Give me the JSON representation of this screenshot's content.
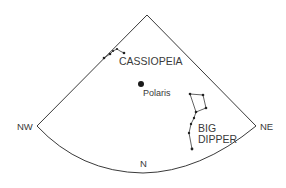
{
  "diagram": {
    "colors": {
      "line": "#3a3a3a",
      "text": "#3a3a3a",
      "background": "#ffffff"
    },
    "directions": {
      "nw": "NW",
      "ne": "NE",
      "n": "N"
    },
    "constellations": {
      "cassiopeia": {
        "label": "CASSIOPEIA"
      },
      "big_dipper": {
        "label_line1": "BIG",
        "label_line2": "DIPPER"
      }
    },
    "stars": {
      "polaris": {
        "label": "Polaris"
      }
    }
  }
}
